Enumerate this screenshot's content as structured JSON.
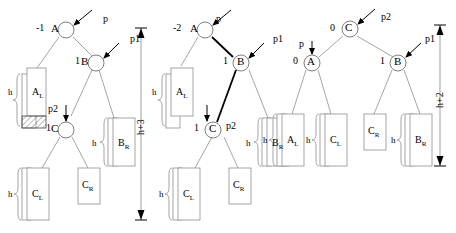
{
  "figure": {
    "type": "avl-double-rotation-diagram",
    "panels": [
      {
        "id": "before",
        "nodes": [
          {
            "name": "A",
            "label": "A",
            "balance": "-1",
            "pointer": "p",
            "pointer_style": "arrow-from-upper-right"
          },
          {
            "name": "B",
            "label": "B",
            "balance": "1",
            "pointer": "p1",
            "pointer_style": "arrow-from-upper-right"
          },
          {
            "name": "C",
            "label": "C",
            "balance": "1",
            "pointer": "p2",
            "pointer_style": "arrow-from-above"
          }
        ],
        "subtrees": [
          {
            "label": "AL",
            "text": "A",
            "sub": "L",
            "brace": "h",
            "style": "stacked-with-hatch"
          },
          {
            "label": "BR",
            "text": "B",
            "sub": "R",
            "brace": "h",
            "style": "stacked"
          },
          {
            "label": "CL",
            "text": "C",
            "sub": "L",
            "brace": "h",
            "style": "stacked"
          },
          {
            "label": "CR",
            "text": "C",
            "sub": "R",
            "brace": "",
            "style": "plain"
          }
        ],
        "height_brace": "h+3"
      },
      {
        "id": "middle",
        "nodes": [
          {
            "name": "A",
            "label": "A",
            "balance": "-2",
            "pointer": "p",
            "pointer_style": "arrow-from-upper-right"
          },
          {
            "name": "B",
            "label": "B",
            "balance": "1",
            "pointer": "p1",
            "pointer_style": "arrow-from-upper-right"
          },
          {
            "name": "C",
            "label": "C",
            "balance": "1",
            "pointer": "p2",
            "pointer_style": "arrow-from-above"
          }
        ],
        "subtrees": [
          {
            "label": "AL",
            "text": "A",
            "sub": "L",
            "brace": "h",
            "style": "stacked"
          },
          {
            "label": "BR",
            "text": "B",
            "sub": "R",
            "brace": "h",
            "style": "stacked"
          },
          {
            "label": "CL",
            "text": "C",
            "sub": "L",
            "brace": "h",
            "style": "stacked"
          },
          {
            "label": "CR",
            "text": "C",
            "sub": "R",
            "brace": "",
            "style": "plain"
          }
        ],
        "height_brace": ""
      },
      {
        "id": "after",
        "nodes": [
          {
            "name": "C",
            "label": "C",
            "balance": "0",
            "pointer": "p2",
            "pointer_style": "arrow-from-upper-right"
          },
          {
            "name": "A",
            "label": "A",
            "balance": "0",
            "pointer": "p",
            "pointer_style": "arrow-from-above"
          },
          {
            "name": "B",
            "label": "B",
            "balance": "1",
            "pointer": "p1",
            "pointer_style": "arrow-from-upper-right"
          }
        ],
        "subtrees": [
          {
            "label": "AL",
            "text": "A",
            "sub": "L",
            "brace": "h",
            "style": "stacked"
          },
          {
            "label": "CL",
            "text": "C",
            "sub": "L",
            "brace": "h",
            "style": "stacked"
          },
          {
            "label": "CR",
            "text": "C",
            "sub": "R",
            "brace": "",
            "style": "plain"
          },
          {
            "label": "BR",
            "text": "B",
            "sub": "R",
            "brace": "h",
            "style": "stacked"
          }
        ],
        "height_brace": "h+2"
      }
    ],
    "text": {
      "A": "A",
      "B": "B",
      "C": "C",
      "sub_L": "L",
      "sub_R": "R",
      "h": "h",
      "bal_minus1": "-1",
      "bal_minus2": "-2",
      "bal_one": "1",
      "bal_zero": "0",
      "p": "p",
      "p1": "p1",
      "p2": "p2",
      "hplus3": "h+3",
      "hplus2": "h+2"
    },
    "colors": {
      "stroke": "#000000",
      "light_stroke": "#9a9a9a",
      "bold_stroke": "#000000",
      "background": "#ffffff"
    }
  }
}
